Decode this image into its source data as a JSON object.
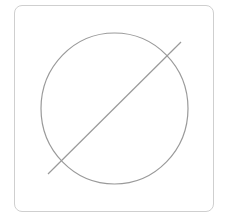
{
  "diagram": {
    "frame": {
      "x": 14,
      "y": 5,
      "width": 200,
      "height": 207,
      "corner_radius": 8,
      "stroke_color": "#cfcfcf"
    },
    "circle": {
      "cx": 114.5,
      "cy": 108.5,
      "rx": 73.5,
      "ry": 75.5,
      "stroke_color": "#9a9a9a",
      "stroke_width": 1.2
    },
    "line": {
      "x1": 48,
      "y1": 174,
      "x2": 181,
      "y2": 42,
      "stroke_color": "#9a9a9a",
      "stroke_width": 1.2
    }
  }
}
